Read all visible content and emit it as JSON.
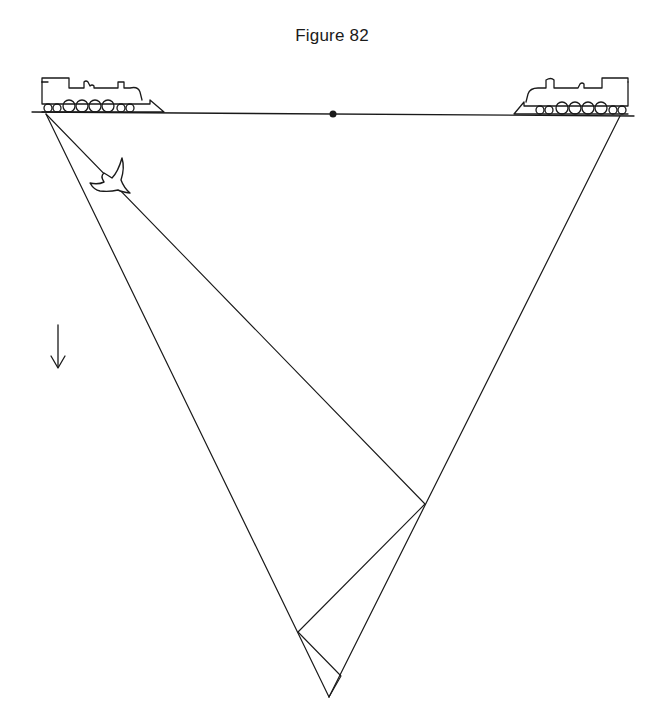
{
  "figure": {
    "title": "Figure 82",
    "line_color": "#1a1a1a",
    "elements": {
      "track": {
        "x1": 32,
        "y1": 112,
        "x2": 634,
        "y2": 116
      },
      "midpoint_dot": {
        "x": 333,
        "y": 114
      },
      "left_train": {
        "x": 40,
        "y": 70,
        "facing": "right"
      },
      "right_train": {
        "x": 518,
        "y": 72,
        "facing": "left"
      },
      "bird": {
        "x": 105,
        "y": 175
      },
      "down_arrow": {
        "x": 58,
        "y1": 325,
        "y2": 368
      },
      "triangle": {
        "left_vertex": [
          46,
          114
        ],
        "right_vertex": [
          620,
          116
        ],
        "bottom_vertex": [
          329,
          697
        ]
      },
      "zigzag_path": [
        [
          46,
          114
        ],
        [
          425,
          504
        ],
        [
          298,
          632
        ],
        [
          341,
          676
        ],
        [
          329,
          697
        ]
      ]
    }
  }
}
